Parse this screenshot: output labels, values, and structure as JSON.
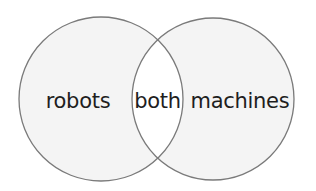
{
  "diagram": {
    "type": "venn",
    "sets": [
      {
        "id": "left",
        "label": "robots"
      },
      {
        "id": "right",
        "label": "machines"
      }
    ],
    "intersection": {
      "label": "both"
    }
  },
  "colors": {
    "circle_fill": "#f4f4f4",
    "intersection_fill": "#ffffff",
    "stroke": "#7a7a7a",
    "text": "#1e1e1e"
  }
}
